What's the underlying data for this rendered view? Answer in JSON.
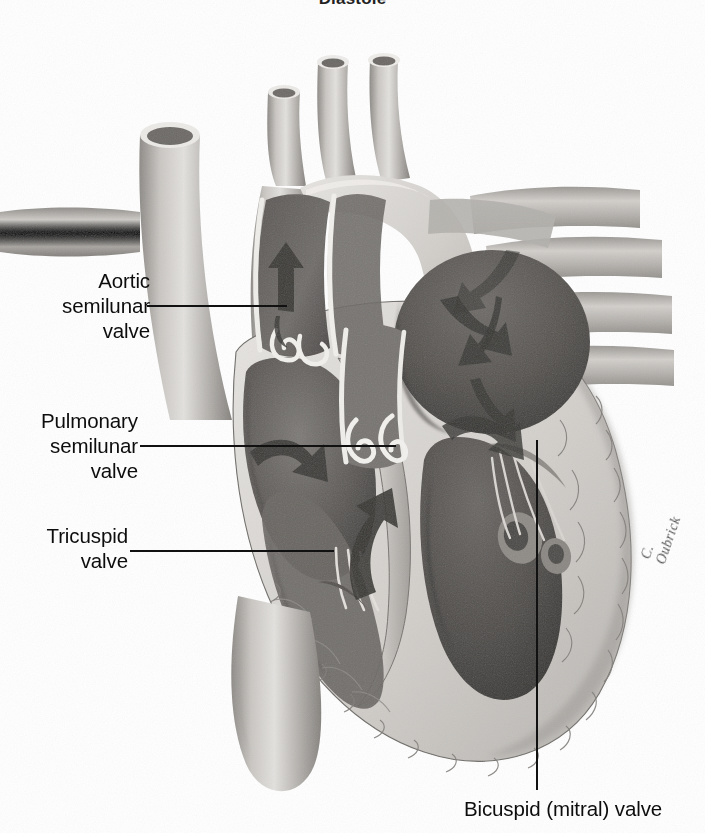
{
  "figure": {
    "title": "Diastole",
    "signature": "C. Oubrick",
    "style": "grayscale airbrush medical illustration"
  },
  "labels": [
    {
      "id": "aortic-semilunar-valve",
      "text": "Aortic\nsemilunar\nvalve",
      "align": "right",
      "x": 12,
      "y": 268,
      "width": 138,
      "leader": {
        "type": "h",
        "x": 147,
        "y": 305,
        "length": 140
      }
    },
    {
      "id": "pulmonary-semilunar-valve",
      "text": "Pulmonary\nsemilunar\nvalve",
      "align": "right",
      "x": 4,
      "y": 408,
      "width": 134,
      "leader": {
        "type": "h",
        "x": 140,
        "y": 445,
        "length": 256
      }
    },
    {
      "id": "tricuspid-valve",
      "text": "Tricuspid\nvalve",
      "align": "right",
      "x": 18,
      "y": 523,
      "width": 110,
      "leader": {
        "type": "h",
        "x": 130,
        "y": 550,
        "length": 204
      }
    },
    {
      "id": "bicuspid-mitral-valve",
      "text": "Bicuspid (mitral) valve",
      "align": "center",
      "x": 432,
      "y": 796,
      "width": 262,
      "leader": {
        "type": "v",
        "x": 536,
        "y": 440,
        "length": 350
      }
    }
  ],
  "anatomy": {
    "vessels": [
      {
        "name": "brachiocephalic-trunk"
      },
      {
        "name": "left-common-carotid-artery"
      },
      {
        "name": "left-subclavian-artery"
      },
      {
        "name": "superior-vena-cava"
      },
      {
        "name": "aortic-arch"
      },
      {
        "name": "descending-aorta"
      },
      {
        "name": "inferior-vena-cava"
      },
      {
        "name": "right-pulmonary-veins"
      },
      {
        "name": "pulmonary-trunk"
      }
    ],
    "chambers": [
      {
        "name": "right-atrium"
      },
      {
        "name": "right-ventricle"
      },
      {
        "name": "left-atrium"
      },
      {
        "name": "left-ventricle"
      }
    ],
    "flow_arrows": [
      {
        "name": "flow-arrow-aorta-up"
      },
      {
        "name": "flow-arrow-right-atrium"
      },
      {
        "name": "flow-arrow-into-right-ventricle"
      },
      {
        "name": "flow-arrow-left-atrium-inflow"
      },
      {
        "name": "flow-arrow-into-left-ventricle"
      },
      {
        "name": "flow-arrow-pulmonary-trunk"
      }
    ]
  },
  "colors": {
    "ink": "#111111",
    "background": "#ffffff",
    "tissue_light": "#d9d6d2",
    "tissue_mid": "#a9a6a2",
    "tissue_dark": "#6e6b68",
    "cavity_dark": "#55524f",
    "cavity_darker": "#3d3b39",
    "highlight": "#f2f0ee"
  }
}
